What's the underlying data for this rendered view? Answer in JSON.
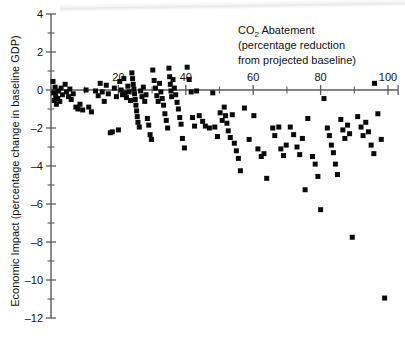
{
  "chart_data": {
    "type": "scatter",
    "title": "",
    "xlabel": "CO2 Abatement (percentage reduction from projected baseline)",
    "ylabel": "Economic Impact (percentage change in baseline GDP)",
    "xlim": [
      0,
      103
    ],
    "ylim": [
      -12,
      4
    ],
    "grid": false,
    "legend": null,
    "x_ticks": [
      0,
      10,
      20,
      30,
      40,
      50,
      60,
      70,
      80,
      90,
      100
    ],
    "x_tick_labels": [
      "",
      "",
      "20",
      "",
      "40",
      "",
      "60",
      "",
      "80",
      "",
      "100"
    ],
    "y_ticks": [
      4,
      3,
      2,
      1,
      0,
      -1,
      -2,
      -3,
      -4,
      -5,
      -6,
      -7,
      -8,
      -9,
      -10,
      -11,
      -12
    ],
    "y_tick_labels": [
      "4",
      "",
      "2",
      "",
      "0",
      "",
      "-2",
      "",
      "-4",
      "",
      "-6",
      "",
      "-8",
      "",
      "-10",
      "",
      "-12"
    ],
    "marker": "square",
    "marker_color": "#0a0a0a",
    "points": [
      [
        0.6,
        0.45
      ],
      [
        0.8,
        -0.15
      ],
      [
        1.0,
        -0.55
      ],
      [
        1.2,
        0.15
      ],
      [
        1.4,
        -0.3
      ],
      [
        1.6,
        -0.75
      ],
      [
        2.0,
        -0.45
      ],
      [
        2.2,
        -0.05
      ],
      [
        2.6,
        -0.6
      ],
      [
        3.0,
        0.1
      ],
      [
        3.4,
        -0.25
      ],
      [
        4.2,
        0.3
      ],
      [
        4.6,
        -0.1
      ],
      [
        5.2,
        -0.35
      ],
      [
        5.6,
        0.05
      ],
      [
        6.0,
        -0.5
      ],
      [
        6.6,
        -0.2
      ],
      [
        7.4,
        -0.9
      ],
      [
        8.0,
        -1.0
      ],
      [
        8.6,
        -0.75
      ],
      [
        9.4,
        -1.05
      ],
      [
        10.4,
        0.0
      ],
      [
        11.2,
        -0.9
      ],
      [
        12.0,
        -1.15
      ],
      [
        13.2,
        -0.05
      ],
      [
        14.0,
        -0.3
      ],
      [
        14.6,
        0.35
      ],
      [
        15.2,
        -0.1
      ],
      [
        15.8,
        -0.6
      ],
      [
        16.4,
        0.25
      ],
      [
        17.0,
        -0.2
      ],
      [
        17.6,
        -2.25
      ],
      [
        18.2,
        -2.2
      ],
      [
        18.8,
        0.1
      ],
      [
        19.4,
        -0.35
      ],
      [
        20.0,
        -2.1
      ],
      [
        20.4,
        0.45
      ],
      [
        20.8,
        0.0
      ],
      [
        21.2,
        -0.25
      ],
      [
        21.6,
        0.6
      ],
      [
        22.0,
        -0.15
      ],
      [
        22.4,
        -0.4
      ],
      [
        22.8,
        0.2
      ],
      [
        23.2,
        -0.1
      ],
      [
        23.6,
        -0.55
      ],
      [
        24.0,
        0.9
      ],
      [
        24.2,
        0.6
      ],
      [
        24.4,
        0.3
      ],
      [
        24.6,
        0.05
      ],
      [
        24.8,
        -0.2
      ],
      [
        25.0,
        -0.5
      ],
      [
        25.2,
        -0.8
      ],
      [
        25.4,
        -1.1
      ],
      [
        25.6,
        -1.4
      ],
      [
        25.8,
        -1.7
      ],
      [
        26.2,
        -1.95
      ],
      [
        26.6,
        -0.05
      ],
      [
        27.0,
        -0.35
      ],
      [
        27.4,
        0.15
      ],
      [
        27.8,
        -0.6
      ],
      [
        28.2,
        -0.25
      ],
      [
        28.6,
        -1.5
      ],
      [
        29.0,
        -1.85
      ],
      [
        29.4,
        -2.35
      ],
      [
        29.8,
        -2.6
      ],
      [
        30.2,
        1.05
      ],
      [
        30.6,
        0.5
      ],
      [
        31.0,
        0.1
      ],
      [
        31.4,
        -0.3
      ],
      [
        31.8,
        -0.6
      ],
      [
        32.2,
        0.35
      ],
      [
        32.6,
        -0.1
      ],
      [
        33.0,
        -0.45
      ],
      [
        33.4,
        -0.8
      ],
      [
        33.8,
        -1.25
      ],
      [
        34.2,
        -1.6
      ],
      [
        34.6,
        -2.0
      ],
      [
        35.0,
        1.15
      ],
      [
        35.2,
        0.7
      ],
      [
        35.4,
        0.3
      ],
      [
        35.6,
        -0.05
      ],
      [
        35.8,
        -0.35
      ],
      [
        36.2,
        0.55
      ],
      [
        36.6,
        0.1
      ],
      [
        37.0,
        -0.25
      ],
      [
        37.4,
        -0.65
      ],
      [
        37.8,
        -1.0
      ],
      [
        38.2,
        -1.45
      ],
      [
        38.6,
        -1.8
      ],
      [
        39.0,
        -2.55
      ],
      [
        39.6,
        -3.05
      ],
      [
        40.4,
        1.2
      ],
      [
        41.0,
        0.55
      ],
      [
        41.6,
        -0.1
      ],
      [
        42.0,
        -1.45
      ],
      [
        42.6,
        -1.9
      ],
      [
        43.2,
        -0.05
      ],
      [
        44.0,
        -1.35
      ],
      [
        45.0,
        -1.65
      ],
      [
        45.8,
        -1.9
      ],
      [
        47.0,
        -2.0
      ],
      [
        48.0,
        -0.15
      ],
      [
        48.6,
        -1.95
      ],
      [
        49.4,
        -2.45
      ],
      [
        50.2,
        -1.2
      ],
      [
        50.8,
        -1.6
      ],
      [
        51.4,
        -0.9
      ],
      [
        51.8,
        -1.35
      ],
      [
        52.2,
        -1.75
      ],
      [
        52.6,
        -2.15
      ],
      [
        53.2,
        -2.5
      ],
      [
        53.8,
        -1.3
      ],
      [
        54.4,
        -2.8
      ],
      [
        55.0,
        -3.2
      ],
      [
        55.6,
        -3.6
      ],
      [
        56.2,
        -4.25
      ],
      [
        57.4,
        -0.95
      ],
      [
        58.8,
        -2.6
      ],
      [
        60.2,
        -1.35
      ],
      [
        61.4,
        -3.1
      ],
      [
        62.4,
        -3.5
      ],
      [
        63.2,
        -3.35
      ],
      [
        64.0,
        -4.65
      ],
      [
        65.8,
        -2.0
      ],
      [
        66.4,
        -2.4
      ],
      [
        67.6,
        -1.95
      ],
      [
        68.2,
        -3.1
      ],
      [
        69.0,
        -3.45
      ],
      [
        69.8,
        -2.9
      ],
      [
        71.0,
        -1.95
      ],
      [
        72.0,
        -2.35
      ],
      [
        73.0,
        -3.0
      ],
      [
        73.8,
        -3.4
      ],
      [
        74.6,
        -2.55
      ],
      [
        75.4,
        -5.25
      ],
      [
        76.2,
        -1.5
      ],
      [
        77.6,
        -3.5
      ],
      [
        78.4,
        -3.9
      ],
      [
        79.2,
        -4.55
      ],
      [
        80.0,
        -6.3
      ],
      [
        81.0,
        -0.45
      ],
      [
        82.0,
        -2.0
      ],
      [
        82.6,
        -2.4
      ],
      [
        83.2,
        -2.9
      ],
      [
        83.8,
        -3.3
      ],
      [
        84.4,
        -3.9
      ],
      [
        85.0,
        -4.45
      ],
      [
        86.0,
        -1.55
      ],
      [
        86.6,
        -2.1
      ],
      [
        87.2,
        -2.55
      ],
      [
        88.0,
        -1.85
      ],
      [
        88.6,
        -2.3
      ],
      [
        89.4,
        -7.75
      ],
      [
        91.0,
        -1.4
      ],
      [
        92.0,
        -1.95
      ],
      [
        92.6,
        -2.4
      ],
      [
        93.4,
        -1.7
      ],
      [
        94.2,
        -2.2
      ],
      [
        95.0,
        -2.9
      ],
      [
        95.8,
        -3.35
      ],
      [
        96.0,
        0.35
      ],
      [
        97.0,
        -1.25
      ],
      [
        98.0,
        -2.6
      ],
      [
        99.0,
        -10.95
      ]
    ]
  },
  "annotations": {
    "title_line1": "CO",
    "title_sub": "2",
    "title_line1b": " Abatement",
    "title_line2": "(percentage reduction",
    "title_line3": "from projected baseline)",
    "ylabel_text": "Economic Impact (percentage change in baseline GDP)"
  }
}
